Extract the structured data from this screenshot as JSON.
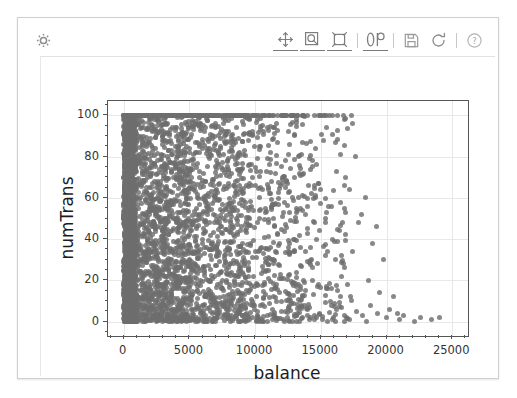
{
  "widget": {
    "spinner_icon": "gear-icon",
    "toolbar": [
      {
        "name": "pan-axes-icon",
        "label": "Pan axes with left mouse, zoom with right",
        "icon": "move-cross",
        "underlined": true
      },
      {
        "name": "zoom-rect-icon",
        "label": "Zoom to rectangle",
        "icon": "magnifier",
        "underlined": true
      },
      {
        "name": "reset-view-icon",
        "label": "Reset original view",
        "icon": "home-frame",
        "underlined": true
      },
      {
        "name": "separator-1",
        "label": "",
        "icon": "separator",
        "underlined": false
      },
      {
        "name": "configure-subplots-icon",
        "label": "Configure subplots",
        "icon": "sliders",
        "underlined": true
      },
      {
        "name": "separator-2",
        "label": "",
        "icon": "separator",
        "underlined": false
      },
      {
        "name": "save-figure-icon",
        "label": "Download plot",
        "icon": "floppy",
        "underlined": false
      },
      {
        "name": "refresh-icon",
        "label": "Refresh",
        "icon": "reload",
        "underlined": false
      },
      {
        "name": "separator-3",
        "label": "",
        "icon": "separator",
        "underlined": false
      },
      {
        "name": "help-icon",
        "label": "Help",
        "icon": "question",
        "underlined": false
      }
    ]
  },
  "chart_data": {
    "type": "scatter",
    "title": "",
    "xlabel": "balance",
    "ylabel": "numTrans",
    "xlim": [
      -1200,
      26200
    ],
    "ylim": [
      -7,
      107
    ],
    "xticks": [
      0,
      5000,
      10000,
      15000,
      20000,
      25000
    ],
    "xtick_labels": [
      "0",
      "5000",
      "10000",
      "15000",
      "20000",
      "25000"
    ],
    "yticks": [
      0,
      20,
      40,
      60,
      80,
      100
    ],
    "ytick_labels": [
      "0",
      "20",
      "40",
      "60",
      "80",
      "100"
    ],
    "x_minor_step": 1000,
    "y_minor_step": 5,
    "grid": true,
    "grid_color": "#e8e8e8",
    "marker": {
      "color": "#6e6e6e",
      "size": 5,
      "opacity": 0.82,
      "shape": "circle"
    },
    "n_points": 1680,
    "points": [
      [
        40,
        100
      ],
      [
        60,
        100
      ],
      [
        95,
        100
      ],
      [
        150,
        100
      ],
      [
        210,
        100
      ],
      [
        260,
        100
      ],
      [
        330,
        100
      ],
      [
        400,
        100
      ],
      [
        470,
        100
      ],
      [
        520,
        100
      ],
      [
        600,
        100
      ],
      [
        700,
        100
      ],
      [
        790,
        100
      ],
      [
        880,
        100
      ],
      [
        960,
        100
      ],
      [
        1050,
        100
      ],
      [
        1150,
        100
      ],
      [
        1260,
        100
      ],
      [
        1390,
        100
      ],
      [
        1480,
        100
      ],
      [
        1600,
        100
      ],
      [
        1700,
        100
      ],
      [
        1830,
        100
      ],
      [
        1950,
        100
      ],
      [
        2060,
        100
      ],
      [
        2200,
        100
      ],
      [
        2340,
        100
      ],
      [
        2460,
        100
      ],
      [
        2580,
        100
      ],
      [
        2700,
        100
      ],
      [
        2840,
        100
      ],
      [
        2980,
        100
      ],
      [
        3120,
        100
      ],
      [
        3260,
        100
      ],
      [
        3380,
        100
      ],
      [
        3520,
        100
      ],
      [
        3660,
        100
      ],
      [
        3800,
        100
      ],
      [
        3940,
        100
      ],
      [
        4090,
        100
      ],
      [
        4230,
        100
      ],
      [
        4380,
        100
      ],
      [
        4520,
        100
      ],
      [
        4660,
        100
      ],
      [
        4800,
        100
      ],
      [
        4950,
        100
      ],
      [
        5100,
        100
      ],
      [
        5260,
        100
      ],
      [
        5400,
        100
      ],
      [
        5560,
        100
      ],
      [
        5700,
        100
      ],
      [
        5860,
        100
      ],
      [
        6000,
        100
      ],
      [
        6160,
        100
      ],
      [
        6320,
        100
      ],
      [
        6480,
        100
      ],
      [
        6620,
        100
      ],
      [
        6780,
        100
      ],
      [
        6940,
        100
      ],
      [
        7100,
        100
      ],
      [
        7260,
        100
      ],
      [
        7420,
        100
      ],
      [
        7580,
        100
      ],
      [
        7740,
        100
      ],
      [
        7900,
        100
      ],
      [
        8060,
        100
      ],
      [
        8220,
        100
      ],
      [
        8380,
        100
      ],
      [
        8540,
        100
      ],
      [
        8700,
        100
      ],
      [
        8860,
        100
      ],
      [
        9040,
        100
      ],
      [
        9220,
        100
      ],
      [
        9400,
        100
      ],
      [
        9580,
        100
      ],
      [
        9760,
        100
      ],
      [
        9940,
        100
      ],
      [
        10150,
        100
      ],
      [
        10350,
        100
      ],
      [
        10550,
        100
      ],
      [
        10800,
        100
      ],
      [
        11100,
        100
      ],
      [
        11400,
        100
      ],
      [
        11700,
        100
      ],
      [
        12000,
        100
      ],
      [
        12400,
        100
      ],
      [
        12800,
        100
      ],
      [
        13200,
        100
      ],
      [
        13600,
        100
      ],
      [
        14000,
        100
      ],
      [
        14500,
        100
      ],
      [
        15000,
        100
      ],
      [
        15400,
        100
      ],
      [
        15900,
        100
      ],
      [
        16300,
        100
      ],
      [
        16700,
        100
      ],
      [
        120,
        97
      ],
      [
        480,
        96
      ],
      [
        900,
        95
      ],
      [
        1320,
        94
      ],
      [
        1750,
        93
      ],
      [
        2200,
        95
      ],
      [
        2700,
        92
      ],
      [
        3300,
        96
      ],
      [
        3900,
        94
      ],
      [
        4600,
        91
      ],
      [
        5300,
        93
      ],
      [
        6100,
        95
      ],
      [
        6900,
        90
      ],
      [
        7700,
        92
      ],
      [
        8600,
        94
      ],
      [
        9500,
        91
      ],
      [
        10400,
        93
      ],
      [
        11400,
        89
      ],
      [
        12500,
        92
      ],
      [
        13600,
        87
      ],
      [
        150,
        88
      ],
      [
        520,
        86
      ],
      [
        950,
        89
      ],
      [
        1400,
        85
      ],
      [
        1900,
        87
      ],
      [
        2450,
        84
      ],
      [
        3000,
        88
      ],
      [
        3650,
        83
      ],
      [
        4300,
        86
      ],
      [
        5000,
        82
      ],
      [
        5800,
        85
      ],
      [
        6600,
        81
      ],
      [
        7400,
        84
      ],
      [
        8300,
        80
      ],
      [
        9200,
        83
      ],
      [
        10200,
        79
      ],
      [
        11200,
        82
      ],
      [
        12300,
        78
      ],
      [
        13500,
        81
      ],
      [
        14700,
        76
      ],
      [
        90,
        80
      ],
      [
        380,
        78
      ],
      [
        700,
        81
      ],
      [
        1100,
        77
      ],
      [
        1550,
        79
      ],
      [
        2050,
        75
      ],
      [
        2600,
        78
      ],
      [
        3200,
        74
      ],
      [
        3850,
        77
      ],
      [
        4550,
        73
      ],
      [
        5300,
        76
      ],
      [
        6100,
        72
      ],
      [
        6950,
        75
      ],
      [
        7850,
        71
      ],
      [
        8800,
        74
      ],
      [
        9800,
        70
      ],
      [
        10900,
        73
      ],
      [
        12100,
        69
      ],
      [
        13400,
        72
      ],
      [
        14800,
        67
      ],
      [
        170,
        72
      ],
      [
        560,
        70
      ],
      [
        1000,
        73
      ],
      [
        1480,
        68
      ],
      [
        2000,
        71
      ],
      [
        2580,
        67
      ],
      [
        3200,
        70
      ],
      [
        3880,
        66
      ],
      [
        4600,
        69
      ],
      [
        5380,
        65
      ],
      [
        6200,
        68
      ],
      [
        7080,
        64
      ],
      [
        8000,
        67
      ],
      [
        8980,
        63
      ],
      [
        10000,
        66
      ],
      [
        11100,
        62
      ],
      [
        12300,
        65
      ],
      [
        13600,
        61
      ],
      [
        15000,
        64
      ],
      [
        16500,
        58
      ],
      [
        110,
        64
      ],
      [
        440,
        62
      ],
      [
        820,
        65
      ],
      [
        1250,
        60
      ],
      [
        1720,
        63
      ],
      [
        2240,
        59
      ],
      [
        2810,
        62
      ],
      [
        3430,
        58
      ],
      [
        4100,
        61
      ],
      [
        4820,
        57
      ],
      [
        5600,
        60
      ],
      [
        6430,
        56
      ],
      [
        7320,
        59
      ],
      [
        8260,
        55
      ],
      [
        9260,
        58
      ],
      [
        10320,
        54
      ],
      [
        11450,
        57
      ],
      [
        12650,
        53
      ],
      [
        13950,
        56
      ],
      [
        15350,
        50
      ],
      [
        200,
        56
      ],
      [
        610,
        54
      ],
      [
        1060,
        57
      ],
      [
        1550,
        52
      ],
      [
        2090,
        55
      ],
      [
        2680,
        51
      ],
      [
        3320,
        54
      ],
      [
        4010,
        50
      ],
      [
        4750,
        53
      ],
      [
        5540,
        49
      ],
      [
        6380,
        52
      ],
      [
        7270,
        48
      ],
      [
        8220,
        51
      ],
      [
        9230,
        47
      ],
      [
        10300,
        50
      ],
      [
        11440,
        46
      ],
      [
        12660,
        49
      ],
      [
        13960,
        45
      ],
      [
        15350,
        48
      ],
      [
        16840,
        42
      ],
      [
        80,
        48
      ],
      [
        350,
        46
      ],
      [
        680,
        49
      ],
      [
        1060,
        45
      ],
      [
        1500,
        47
      ],
      [
        1990,
        43
      ],
      [
        2530,
        46
      ],
      [
        3120,
        42
      ],
      [
        3760,
        45
      ],
      [
        4450,
        41
      ],
      [
        5190,
        44
      ],
      [
        5980,
        40
      ],
      [
        6820,
        43
      ],
      [
        7710,
        39
      ],
      [
        8650,
        42
      ],
      [
        9640,
        38
      ],
      [
        10690,
        41
      ],
      [
        11800,
        37
      ],
      [
        12970,
        40
      ],
      [
        14200,
        36
      ],
      [
        140,
        40
      ],
      [
        470,
        38
      ],
      [
        860,
        41
      ],
      [
        1310,
        37
      ],
      [
        1820,
        39
      ],
      [
        2390,
        35
      ],
      [
        3020,
        38
      ],
      [
        3710,
        34
      ],
      [
        4460,
        37
      ],
      [
        5270,
        33
      ],
      [
        6140,
        36
      ],
      [
        7070,
        32
      ],
      [
        8060,
        35
      ],
      [
        9110,
        31
      ],
      [
        10220,
        34
      ],
      [
        11400,
        30
      ],
      [
        12640,
        33
      ],
      [
        13950,
        29
      ],
      [
        15320,
        32
      ],
      [
        16760,
        28
      ],
      [
        100,
        32
      ],
      [
        400,
        30
      ],
      [
        750,
        33
      ],
      [
        1150,
        29
      ],
      [
        1600,
        31
      ],
      [
        2100,
        27
      ],
      [
        2650,
        30
      ],
      [
        3250,
        26
      ],
      [
        3900,
        29
      ],
      [
        4600,
        25
      ],
      [
        5350,
        28
      ],
      [
        6150,
        24
      ],
      [
        7000,
        27
      ],
      [
        7900,
        23
      ],
      [
        8850,
        26
      ],
      [
        9850,
        22
      ],
      [
        10900,
        25
      ],
      [
        12000,
        21
      ],
      [
        13150,
        24
      ],
      [
        14350,
        20
      ],
      [
        180,
        24
      ],
      [
        540,
        22
      ],
      [
        960,
        25
      ],
      [
        1440,
        21
      ],
      [
        1980,
        23
      ],
      [
        2580,
        19
      ],
      [
        3240,
        22
      ],
      [
        3960,
        18
      ],
      [
        4740,
        21
      ],
      [
        5580,
        17
      ],
      [
        6480,
        20
      ],
      [
        7440,
        16
      ],
      [
        8460,
        19
      ],
      [
        9540,
        15
      ],
      [
        10680,
        18
      ],
      [
        11880,
        14
      ],
      [
        13140,
        17
      ],
      [
        14460,
        13
      ],
      [
        15840,
        16
      ],
      [
        17280,
        12
      ],
      [
        60,
        16
      ],
      [
        300,
        14
      ],
      [
        600,
        17
      ],
      [
        960,
        13
      ],
      [
        1380,
        15
      ],
      [
        1860,
        11
      ],
      [
        2400,
        14
      ],
      [
        3000,
        10
      ],
      [
        3660,
        13
      ],
      [
        4380,
        9
      ],
      [
        5160,
        12
      ],
      [
        6000,
        8
      ],
      [
        6900,
        11
      ],
      [
        7860,
        7
      ],
      [
        8880,
        10
      ],
      [
        9960,
        6
      ],
      [
        11100,
        9
      ],
      [
        12300,
        5
      ],
      [
        13560,
        8
      ],
      [
        14880,
        4
      ],
      [
        130,
        8
      ],
      [
        420,
        6
      ],
      [
        780,
        9
      ],
      [
        1200,
        5
      ],
      [
        1680,
        7
      ],
      [
        2220,
        3
      ],
      [
        2820,
        6
      ],
      [
        3480,
        2
      ],
      [
        4200,
        5
      ],
      [
        4980,
        1
      ],
      [
        5820,
        4
      ],
      [
        6720,
        0
      ],
      [
        7680,
        3
      ],
      [
        8700,
        0
      ],
      [
        9780,
        2
      ],
      [
        10920,
        0
      ],
      [
        12120,
        1
      ],
      [
        13380,
        0
      ],
      [
        14700,
        2
      ],
      [
        16080,
        0
      ],
      [
        220,
        1
      ],
      [
        640,
        0
      ],
      [
        1120,
        2
      ],
      [
        1660,
        0
      ],
      [
        2260,
        1
      ],
      [
        2920,
        0
      ],
      [
        3640,
        2
      ],
      [
        4420,
        0
      ],
      [
        5260,
        1
      ],
      [
        6160,
        0
      ],
      [
        7120,
        2
      ],
      [
        8140,
        0
      ],
      [
        9220,
        1
      ],
      [
        10360,
        0
      ],
      [
        11560,
        2
      ],
      [
        12820,
        0
      ],
      [
        14140,
        1
      ],
      [
        15520,
        0
      ],
      [
        16960,
        2
      ],
      [
        18460,
        0
      ],
      [
        17600,
        80
      ],
      [
        18400,
        60
      ],
      [
        17900,
        48
      ],
      [
        19200,
        46
      ],
      [
        18900,
        38
      ],
      [
        19800,
        30
      ],
      [
        20500,
        12
      ],
      [
        21300,
        3
      ],
      [
        22600,
        2
      ],
      [
        24000,
        2
      ],
      [
        17200,
        64
      ],
      [
        18100,
        52
      ],
      [
        16900,
        70
      ],
      [
        17400,
        34
      ],
      [
        18600,
        20
      ],
      [
        19500,
        14
      ],
      [
        20200,
        6
      ],
      [
        21000,
        1
      ],
      [
        22100,
        0
      ],
      [
        23400,
        1
      ],
      [
        16400,
        44
      ],
      [
        16800,
        26
      ],
      [
        17000,
        18
      ],
      [
        17300,
        10
      ],
      [
        17700,
        5
      ],
      [
        18200,
        3
      ],
      [
        18800,
        8
      ],
      [
        19300,
        4
      ],
      [
        20000,
        2
      ],
      [
        20800,
        4
      ],
      [
        15200,
        88
      ],
      [
        15600,
        56
      ],
      [
        15900,
        40
      ],
      [
        16100,
        30
      ],
      [
        16600,
        22
      ],
      [
        15400,
        16
      ],
      [
        15800,
        8
      ],
      [
        16200,
        6
      ],
      [
        16500,
        12
      ],
      [
        16000,
        2
      ],
      [
        14200,
        74
      ],
      [
        14600,
        60
      ],
      [
        14900,
        44
      ],
      [
        13800,
        34
      ],
      [
        14400,
        26
      ],
      [
        14800,
        18
      ],
      [
        13600,
        12
      ],
      [
        14000,
        6
      ],
      [
        14500,
        3
      ],
      [
        15100,
        1
      ]
    ]
  }
}
